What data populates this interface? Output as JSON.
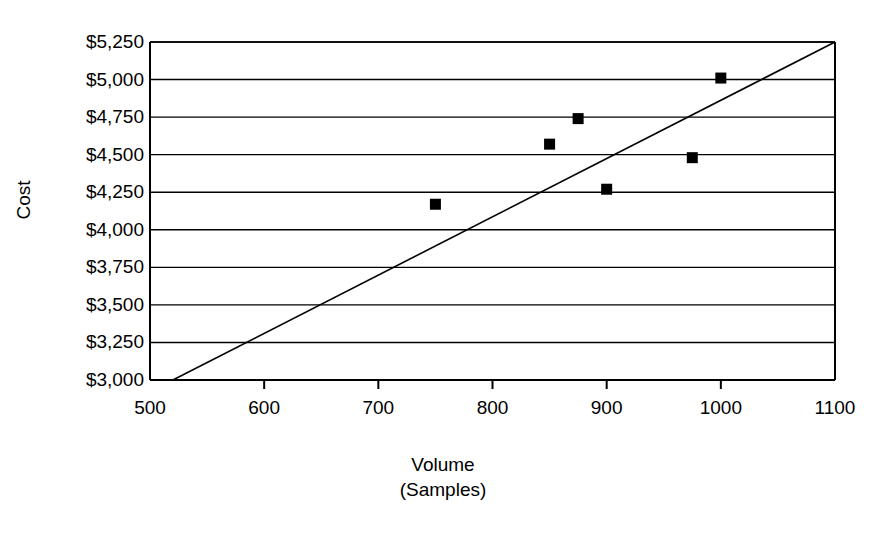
{
  "chart_data": {
    "type": "scatter",
    "title": "",
    "xlabel": "Volume",
    "xlabel_sub": "(Samples)",
    "ylabel": "Cost",
    "xlim": [
      500,
      1100
    ],
    "ylim": [
      3000,
      5250
    ],
    "grid": "horizontal",
    "legend": "none",
    "x_ticks": [
      500,
      600,
      700,
      800,
      900,
      1000,
      1100
    ],
    "x_tick_labels": [
      "500",
      "600",
      "700",
      "800",
      "900",
      "1000",
      "1100"
    ],
    "y_ticks": [
      3000,
      3250,
      3500,
      3750,
      4000,
      4250,
      4500,
      4750,
      5000,
      5250
    ],
    "y_tick_labels": [
      "$3,000",
      "$3,250",
      "$3,500",
      "$3,750",
      "$4,000",
      "$4,250",
      "$4,500",
      "$4,750",
      "$5,000",
      "$5,250"
    ],
    "series": [
      {
        "name": "Cost observations",
        "marker": "square",
        "marker_color": "#000000",
        "marker_size": 11,
        "points": [
          {
            "x": 750,
            "y": 4170
          },
          {
            "x": 850,
            "y": 4570
          },
          {
            "x": 875,
            "y": 4740
          },
          {
            "x": 900,
            "y": 4270
          },
          {
            "x": 975,
            "y": 4480
          },
          {
            "x": 1000,
            "y": 5010
          }
        ]
      },
      {
        "name": "Fitted trend line",
        "marker": "none",
        "line_color": "#000000",
        "line_width": 1.6,
        "points": [
          {
            "x": 520,
            "y": 3000
          },
          {
            "x": 1100,
            "y": 5250
          }
        ]
      }
    ],
    "axis_color": "#000000",
    "grid_color": "#000000",
    "background_color": "#ffffff"
  },
  "layout": {
    "plot_left": 150,
    "plot_right": 835,
    "plot_top": 42,
    "plot_bottom": 380
  }
}
